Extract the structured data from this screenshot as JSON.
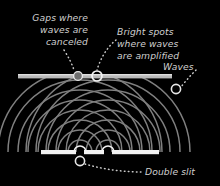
{
  "diagram": {
    "background_color": "#000000",
    "text_color": "#cfcfcf",
    "labels": {
      "gaps": {
        "name": "gaps-where-waves-are-canceled",
        "line1": "Gaps where",
        "line2": "waves are",
        "line3": "canceled"
      },
      "bright": {
        "name": "bright-spots-where-waves-are-amplified",
        "line1": "Bright spots",
        "line2": "where waves",
        "line3": "are amplified"
      },
      "waves": {
        "name": "waves",
        "line1": "Waves"
      },
      "double_slit": {
        "name": "double-slit",
        "line1": "Double slit"
      }
    },
    "elements": {
      "screen_bar": {
        "name": "detection-screen-bar",
        "color": "#b9b9b9",
        "x1": 18,
        "x2": 172,
        "y": 76,
        "thickness": 4
      },
      "slit_bar": {
        "name": "double-slit-barrier",
        "color": "#f2f2f2",
        "x1": 41,
        "x2": 159,
        "y": 152,
        "thickness": 4,
        "slit_positions": [
          80,
          108
        ],
        "slit_width": 8
      },
      "markers": [
        {
          "name": "marker-dark-fringe",
          "cx": 78,
          "cy": 76,
          "r": 4.4,
          "filled": true,
          "stroke": "#e8e8e8"
        },
        {
          "name": "marker-bright-fringe",
          "cx": 97,
          "cy": 76,
          "r": 5.0,
          "filled": false,
          "stroke": "#f0f0f0"
        },
        {
          "name": "marker-waves",
          "cx": 176,
          "cy": 89,
          "r": 4.6,
          "filled": false,
          "stroke": "#e6e6e6"
        },
        {
          "name": "marker-slit",
          "cx": 80,
          "cy": 161,
          "r": 4.6,
          "filled": false,
          "stroke": "#e6e6e6"
        }
      ],
      "waves": {
        "name": "interference-wavefronts",
        "color": "#8e8e8e",
        "source_left_x": 80,
        "source_right_x": 108,
        "source_y": 152,
        "radii": [
          10,
          20,
          30,
          40,
          50,
          60,
          70,
          80,
          90
        ]
      }
    }
  }
}
